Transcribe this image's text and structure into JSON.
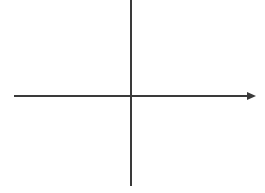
{
  "figure": {
    "title": "",
    "background_color": "#ffffff",
    "width": 265,
    "height": 193
  },
  "chart_data": {
    "type": "line",
    "title": "",
    "subtitle": "",
    "xlabel": "",
    "ylabel": "",
    "grid": false,
    "legend": null,
    "series": [],
    "categories": [],
    "values": [],
    "annotations": [],
    "axes": {
      "origin": {
        "x": 131,
        "y": 96
      },
      "x_axis": {
        "name": "horizontal-axis",
        "x_start": 14,
        "x_end": 248,
        "y": 96,
        "stroke_width": 2,
        "color": "#3a3a3a",
        "arrow_start": false,
        "arrow_end": true,
        "label": "",
        "ticks": [],
        "tick_labels": []
      },
      "y_axis": {
        "name": "vertical-axis",
        "x": 131,
        "y_start": 0,
        "y_end": 186,
        "stroke_width": 2,
        "color": "#3a3a3a",
        "arrow_start": false,
        "arrow_end": false,
        "label": "",
        "ticks": [],
        "tick_labels": []
      },
      "arrowhead": {
        "name": "x-axis-arrowhead",
        "tip_x": 256,
        "base_x": 247,
        "half_height": 4,
        "y": 96,
        "color": "#3a3a3a"
      }
    },
    "quadrants": [
      {
        "name": "quadrant-i",
        "label": "",
        "content": ""
      },
      {
        "name": "quadrant-ii",
        "label": "",
        "content": ""
      },
      {
        "name": "quadrant-iii",
        "label": "",
        "content": ""
      },
      {
        "name": "quadrant-iv",
        "label": "",
        "content": ""
      }
    ]
  }
}
